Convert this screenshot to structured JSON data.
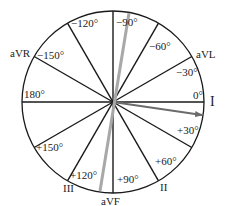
{
  "diagram": {
    "center": {
      "x": 113,
      "y": 102
    },
    "radius": 91,
    "spoke_color": "#1a1a1a",
    "circle_color": "#1a1a1a",
    "angle_labels": [
      {
        "text": "0°",
        "x": 193,
        "y": 99
      },
      {
        "text": "−30°",
        "x": 176,
        "y": 76
      },
      {
        "text": "−60°",
        "x": 149,
        "y": 50
      },
      {
        "text": "−90°",
        "x": 116,
        "y": 26
      },
      {
        "text": "−120°",
        "x": 71,
        "y": 27
      },
      {
        "text": "−150°",
        "x": 37,
        "y": 59
      },
      {
        "text": "180°",
        "x": 24,
        "y": 98
      },
      {
        "text": "+150°",
        "x": 36,
        "y": 151
      },
      {
        "text": "+120°",
        "x": 70,
        "y": 179
      },
      {
        "text": "+90°",
        "x": 117,
        "y": 183
      },
      {
        "text": "+60°",
        "x": 155,
        "y": 165
      },
      {
        "text": "+30°",
        "x": 177,
        "y": 134
      }
    ],
    "lead_labels": [
      {
        "text": "I",
        "x": 210,
        "y": 106
      },
      {
        "text": "aVL",
        "x": 196,
        "y": 58
      },
      {
        "text": "aVR",
        "x": 10,
        "y": 57
      },
      {
        "text": "III",
        "x": 63,
        "y": 192
      },
      {
        "text": "aVF",
        "x": 101,
        "y": 205
      },
      {
        "text": "II",
        "x": 160,
        "y": 191
      }
    ],
    "vectors": [
      {
        "name": "dark-vector",
        "color": "#6b6b6b",
        "x1": 113,
        "y1": 102,
        "x2": 202,
        "y2": 115,
        "arrow": true,
        "width": 2
      },
      {
        "name": "gray-axis-line",
        "color": "#a8a8a8",
        "x1": 100,
        "y1": 191,
        "x2": 129,
        "y2": 13,
        "arrow": false,
        "width": 3
      }
    ]
  }
}
